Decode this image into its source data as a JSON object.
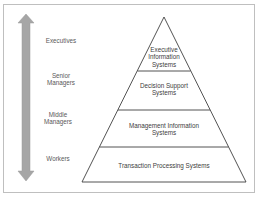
{
  "diagram": {
    "type": "pyramid-hierarchy",
    "arrow": {
      "direction": "bidirectional-vertical",
      "color": "#a6a6a6"
    },
    "levels": [
      {
        "role": "Executives",
        "system": "Executive\nInformation\nSystems"
      },
      {
        "role": "Senior\nManagers",
        "system": "Decision Support\nSystems"
      },
      {
        "role": "Middle\nManagers",
        "system": "Management Information\nSystems"
      },
      {
        "role": "Workers",
        "system": "Transaction Processing Systems"
      }
    ],
    "colors": {
      "outline": "#404040",
      "frame": "#bfbfbf",
      "text": "#595959"
    }
  }
}
